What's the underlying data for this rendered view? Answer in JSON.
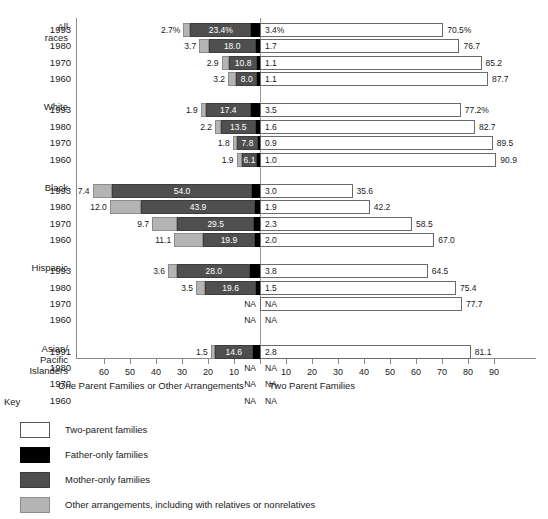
{
  "chart_data": {
    "type": "bar",
    "subtype": "diverging-stacked-horizontal",
    "title": "",
    "xlabel_left": "One Parent Families or Other Arrangements",
    "xlabel_right": "Two Parent Families",
    "ylabel": "",
    "grid": false,
    "legend_position": "below-left",
    "axis": {
      "left_ticks": [
        60,
        50,
        40,
        30,
        20,
        10
      ],
      "right_ticks": [
        10,
        20,
        30,
        40,
        50,
        60,
        70,
        80,
        90
      ],
      "left_max": 65,
      "right_max": 95,
      "units": "percent"
    },
    "series": [
      {
        "name": "Two-parent families",
        "color": "#ffffff",
        "side": "right"
      },
      {
        "name": "Father-only families",
        "color": "#000000",
        "side": "left"
      },
      {
        "name": "Mother-only families",
        "color": "#4f4f4f",
        "side": "left"
      },
      {
        "name": "Other arrangements, including with relatives or nonrelatives",
        "color": "#b4b4b4",
        "side": "left"
      }
    ],
    "groups": [
      {
        "label_lines": [
          "All",
          "races"
        ],
        "rows": [
          {
            "year": "1993",
            "other": 2.7,
            "mother": 23.4,
            "father": 3.4,
            "two": 70.5,
            "other_label": "2.7%",
            "mother_label": "23.4%",
            "father_label": "3.4%",
            "two_label": "70.5%"
          },
          {
            "year": "1980",
            "other": 3.7,
            "mother": 18.0,
            "father": 1.7,
            "two": 76.7,
            "other_label": "3.7",
            "mother_label": "18.0",
            "father_label": "1.7",
            "two_label": "76.7"
          },
          {
            "year": "1970",
            "other": 2.9,
            "mother": 10.8,
            "father": 1.1,
            "two": 85.2,
            "other_label": "2.9",
            "mother_label": "10.8",
            "father_label": "1.1",
            "two_label": "85.2"
          },
          {
            "year": "1960",
            "other": 3.2,
            "mother": 8.0,
            "father": 1.1,
            "two": 87.7,
            "other_label": "3.2",
            "mother_label": "8.0",
            "father_label": "1.1",
            "two_label": "87.7"
          }
        ]
      },
      {
        "label_lines": [
          "White"
        ],
        "rows": [
          {
            "year": "1993",
            "other": 1.9,
            "mother": 17.4,
            "father": 3.5,
            "two": 77.2,
            "other_label": "1.9",
            "mother_label": "17.4",
            "father_label": "3.5",
            "two_label": "77.2%"
          },
          {
            "year": "1980",
            "other": 2.2,
            "mother": 13.5,
            "father": 1.6,
            "two": 82.7,
            "other_label": "2.2",
            "mother_label": "13.5",
            "father_label": "1.6",
            "two_label": "82.7"
          },
          {
            "year": "1970",
            "other": 1.8,
            "mother": 7.8,
            "father": 0.9,
            "two": 89.5,
            "other_label": "1.8",
            "mother_label": "7.8",
            "father_label": "0.9",
            "two_label": "89.5"
          },
          {
            "year": "1960",
            "other": 1.9,
            "mother": 6.1,
            "father": 1.0,
            "two": 90.9,
            "other_label": "1.9",
            "mother_label": "6.1",
            "father_label": "1.0",
            "two_label": "90.9"
          }
        ]
      },
      {
        "label_lines": [
          "Black"
        ],
        "rows": [
          {
            "year": "1993",
            "other": 7.4,
            "mother": 54.0,
            "father": 3.0,
            "two": 35.6,
            "other_label": "7.4",
            "mother_label": "54.0",
            "father_label": "3.0",
            "two_label": "35.6"
          },
          {
            "year": "1980",
            "other": 12.0,
            "mother": 43.9,
            "father": 1.9,
            "two": 42.2,
            "other_label": "12.0",
            "mother_label": "43.9",
            "father_label": "1.9",
            "two_label": "42.2"
          },
          {
            "year": "1970",
            "other": 9.7,
            "mother": 29.5,
            "father": 2.3,
            "two": 58.5,
            "other_label": "9.7",
            "mother_label": "29.5",
            "father_label": "2.3",
            "two_label": "58.5"
          },
          {
            "year": "1960",
            "other": 11.1,
            "mother": 19.9,
            "father": 2.0,
            "two": 67.0,
            "other_label": "11.1",
            "mother_label": "19.9",
            "father_label": "2.0",
            "two_label": "67.0"
          }
        ]
      },
      {
        "label_lines": [
          "Hispanic"
        ],
        "rows": [
          {
            "year": "1993",
            "other": 3.6,
            "mother": 28.0,
            "father": 3.8,
            "two": 64.5,
            "other_label": "3.6",
            "mother_label": "28.0",
            "father_label": "3.8",
            "two_label": "64.5"
          },
          {
            "year": "1980",
            "other": 3.5,
            "mother": 19.6,
            "father": 1.5,
            "two": 75.4,
            "other_label": "3.5",
            "mother_label": "19.6",
            "father_label": "1.5",
            "two_label": "75.4"
          },
          {
            "year": "1970",
            "other": null,
            "mother": null,
            "father": null,
            "two": 77.7,
            "other_label": "NA",
            "mother_label": "",
            "father_label": "NA",
            "two_label": "77.7"
          },
          {
            "year": "1960",
            "other": null,
            "mother": null,
            "father": null,
            "two": null,
            "other_label": "NA",
            "mother_label": "",
            "father_label": "NA",
            "two_label": ""
          }
        ]
      },
      {
        "label_lines": [
          "Asian/",
          "Pacific",
          "Islanders"
        ],
        "rows": [
          {
            "year": "1991",
            "other": 1.5,
            "mother": 14.6,
            "father": 2.8,
            "two": 81.1,
            "other_label": "1.5",
            "mother_label": "14.6",
            "father_label": "2.8",
            "two_label": "81.1"
          },
          {
            "year": "1980",
            "other": null,
            "mother": null,
            "father": null,
            "two": null,
            "other_label": "NA",
            "mother_label": "",
            "father_label": "NA",
            "two_label": ""
          },
          {
            "year": "1970",
            "other": null,
            "mother": null,
            "father": null,
            "two": null,
            "other_label": "NA",
            "mother_label": "",
            "father_label": "NA",
            "two_label": ""
          },
          {
            "year": "1960",
            "other": null,
            "mother": null,
            "father": null,
            "two": null,
            "other_label": "NA",
            "mother_label": "",
            "father_label": "NA",
            "two_label": ""
          }
        ]
      }
    ]
  },
  "key": {
    "title": "Key",
    "items": [
      {
        "swatch": "two",
        "label": "Two-parent families"
      },
      {
        "swatch": "father",
        "label": "Father-only families"
      },
      {
        "swatch": "mother",
        "label": "Mother-only families"
      },
      {
        "swatch": "other",
        "label": "Other arrangements, including with relatives or nonrelatives"
      }
    ]
  }
}
